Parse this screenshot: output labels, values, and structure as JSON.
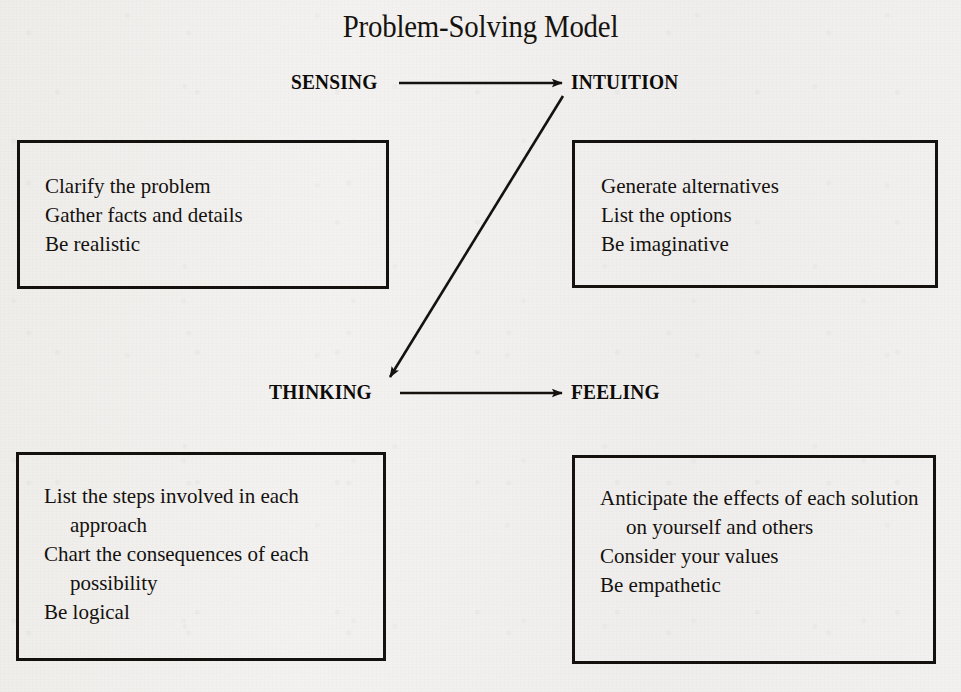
{
  "title": "Problem-Solving Model",
  "colors": {
    "ink": "#14110f",
    "paper": "#f1f0ee"
  },
  "poles": {
    "sensing": "SENSING",
    "intuition": "INTUITION",
    "thinking": "THINKING",
    "feeling": "FEELING"
  },
  "arrows": [
    {
      "name": "sensing-to-intuition",
      "from": "SENSING",
      "to": "INTUITION",
      "direction": "right"
    },
    {
      "name": "intuition-to-thinking",
      "from": "INTUITION",
      "to": "THINKING",
      "direction": "diagonal-down-left"
    },
    {
      "name": "thinking-to-feeling",
      "from": "THINKING",
      "to": "FEELING",
      "direction": "right"
    }
  ],
  "quadrants": {
    "sensing": {
      "label": "SENSING",
      "lines": [
        "Clarify the problem",
        "Gather facts and details",
        "Be realistic"
      ]
    },
    "intuition": {
      "label": "INTUITION",
      "lines": [
        "Generate alternatives",
        "List the options",
        "Be imaginative"
      ]
    },
    "thinking": {
      "label": "THINKING",
      "lines": [
        "List the steps involved in each approach",
        "Chart the consequences of each possibility",
        "Be logical"
      ]
    },
    "feeling": {
      "label": "FEELING",
      "lines": [
        "Anticipate the effects of each solution on yourself and others",
        "Consider your values",
        "Be empathetic"
      ]
    }
  }
}
